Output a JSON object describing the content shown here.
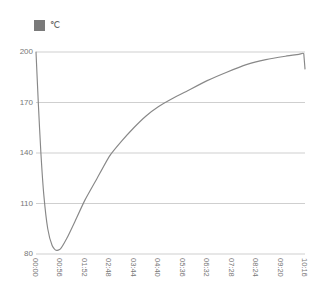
{
  "title": "",
  "legend": {
    "label": "℃",
    "swatch_color": "#7a7a7a"
  },
  "chart_data": {
    "type": "line",
    "title": "",
    "xlabel": "",
    "ylabel": "",
    "ylim": [
      80,
      200
    ],
    "xlim": [
      0,
      11
    ],
    "grid": true,
    "legend_position": "top-left",
    "yticks": [
      80,
      110,
      140,
      170,
      200
    ],
    "categories": [
      "00:00",
      "00:56",
      "01:52",
      "02:48",
      "03:44",
      "04:40",
      "05:36",
      "06:32",
      "07:28",
      "08:24",
      "09:20",
      "10:16"
    ],
    "series": [
      {
        "name": "℃",
        "color": "#888888",
        "values": [
          200.0,
          83.0,
          108.0,
          131.0,
          150.0,
          163.0,
          172.0,
          180.0,
          188.0,
          194.0,
          197.5,
          190.0
        ],
        "points": [
          {
            "x": 0.0,
            "y": 200.0
          },
          {
            "x": 0.1,
            "y": 168.0
          },
          {
            "x": 0.2,
            "y": 140.0
          },
          {
            "x": 0.32,
            "y": 115.0
          },
          {
            "x": 0.48,
            "y": 95.0
          },
          {
            "x": 0.66,
            "y": 85.0
          },
          {
            "x": 0.82,
            "y": 82.2
          },
          {
            "x": 1.0,
            "y": 83.0
          },
          {
            "x": 1.25,
            "y": 89.0
          },
          {
            "x": 1.55,
            "y": 98.0
          },
          {
            "x": 2.0,
            "y": 112.0
          },
          {
            "x": 2.5,
            "y": 125.0
          },
          {
            "x": 3.0,
            "y": 138.0
          },
          {
            "x": 3.5,
            "y": 147.0
          },
          {
            "x": 4.0,
            "y": 155.0
          },
          {
            "x": 4.5,
            "y": 162.0
          },
          {
            "x": 5.0,
            "y": 167.5
          },
          {
            "x": 5.6,
            "y": 172.5
          },
          {
            "x": 6.2,
            "y": 177.0
          },
          {
            "x": 7.0,
            "y": 183.0
          },
          {
            "x": 7.8,
            "y": 188.0
          },
          {
            "x": 8.6,
            "y": 192.5
          },
          {
            "x": 9.4,
            "y": 195.5
          },
          {
            "x": 10.2,
            "y": 197.5
          },
          {
            "x": 10.75,
            "y": 198.6
          },
          {
            "x": 10.95,
            "y": 199.0
          },
          {
            "x": 11.0,
            "y": 190.0
          }
        ]
      }
    ]
  }
}
